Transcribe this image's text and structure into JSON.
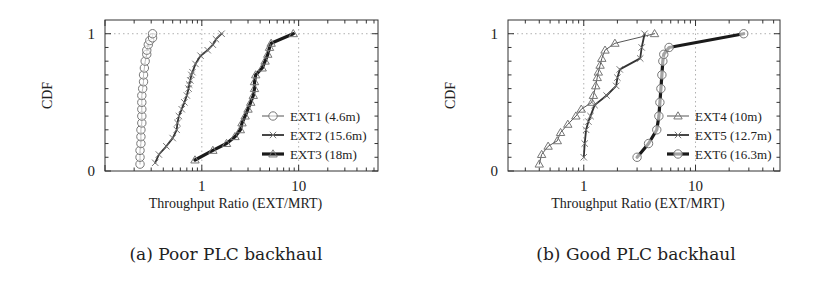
{
  "chart_data": [
    {
      "type": "line",
      "subtitle": "(a) Poor PLC backhaul",
      "xlabel": "Throughput Ratio (EXT/MRT)",
      "ylabel": "CDF",
      "xscale": "log",
      "xlim": [
        0.1,
        66
      ],
      "ylim": [
        0,
        1.1
      ],
      "xticks": [
        1,
        10
      ],
      "xtick_labels": [
        "1",
        "10"
      ],
      "yticks": [
        0,
        1
      ],
      "ytick_labels": [
        "0",
        "1"
      ],
      "grid": true,
      "legend_position": "bottom-right",
      "series": [
        {
          "name": "EXT1 (4.6m)",
          "marker": "circle",
          "line": "thin",
          "x": [
            0.23,
            0.23,
            0.23,
            0.235,
            0.235,
            0.235,
            0.24,
            0.24,
            0.24,
            0.24,
            0.24,
            0.245,
            0.25,
            0.25,
            0.255,
            0.26,
            0.27,
            0.27,
            0.28,
            0.29,
            0.31,
            0.31
          ],
          "y": [
            0.05,
            0.1,
            0.15,
            0.2,
            0.25,
            0.3,
            0.35,
            0.4,
            0.45,
            0.5,
            0.55,
            0.6,
            0.65,
            0.7,
            0.75,
            0.8,
            0.85,
            0.88,
            0.92,
            0.95,
            0.97,
            1.0
          ]
        },
        {
          "name": "EXT2 (15.6m)",
          "marker": "x",
          "line": "medium",
          "x": [
            0.33,
            0.36,
            0.43,
            0.5,
            0.55,
            0.56,
            0.58,
            0.62,
            0.66,
            0.7,
            0.73,
            0.74,
            0.76,
            0.78,
            0.8,
            0.86,
            0.97,
            1.15,
            1.3,
            1.4,
            1.6
          ],
          "y": [
            0.06,
            0.12,
            0.18,
            0.24,
            0.3,
            0.35,
            0.4,
            0.45,
            0.5,
            0.55,
            0.6,
            0.63,
            0.66,
            0.7,
            0.72,
            0.78,
            0.84,
            0.88,
            0.92,
            0.96,
            1.0
          ]
        },
        {
          "name": "EXT3 (18m)",
          "marker": "triangle",
          "line": "thick",
          "x": [
            0.85,
            1.3,
            1.8,
            2.2,
            2.5,
            2.6,
            2.8,
            3.0,
            3.2,
            3.4,
            3.5,
            3.5,
            3.6,
            4.2,
            4.5,
            4.8,
            5.0,
            5.2,
            8.8
          ],
          "y": [
            0.08,
            0.15,
            0.2,
            0.25,
            0.3,
            0.35,
            0.4,
            0.45,
            0.5,
            0.55,
            0.6,
            0.65,
            0.7,
            0.75,
            0.8,
            0.85,
            0.9,
            0.93,
            1.0
          ]
        }
      ]
    },
    {
      "type": "line",
      "subtitle": "(b) Good PLC backhaul",
      "xlabel": "Throughput Ratio (EXT/MRT)",
      "ylabel": "CDF",
      "xscale": "log",
      "xlim": [
        0.21,
        57
      ],
      "ylim": [
        0,
        1.1
      ],
      "xticks": [
        1,
        10
      ],
      "xtick_labels": [
        "1",
        "10"
      ],
      "yticks": [
        0,
        1
      ],
      "ytick_labels": [
        "0",
        "1"
      ],
      "grid": true,
      "legend_position": "bottom-right",
      "series": [
        {
          "name": "EXT4 (10m)",
          "marker": "triangle",
          "line": "thin",
          "x": [
            0.4,
            0.42,
            0.48,
            0.58,
            0.62,
            0.72,
            0.85,
            0.95,
            1.18,
            1.22,
            1.28,
            1.32,
            1.35,
            1.4,
            1.45,
            1.55,
            1.9,
            4.3
          ],
          "y": [
            0.05,
            0.12,
            0.18,
            0.22,
            0.28,
            0.34,
            0.4,
            0.45,
            0.5,
            0.55,
            0.62,
            0.68,
            0.72,
            0.77,
            0.82,
            0.88,
            0.93,
            1.0
          ]
        },
        {
          "name": "EXT5 (12.7m)",
          "marker": "x",
          "line": "medium",
          "x": [
            1.0,
            1.02,
            1.05,
            1.1,
            1.15,
            1.25,
            1.6,
            1.95,
            2.0,
            2.1,
            3.2,
            3.3,
            3.5
          ],
          "y": [
            0.1,
            0.2,
            0.3,
            0.36,
            0.4,
            0.48,
            0.55,
            0.62,
            0.68,
            0.74,
            0.82,
            0.9,
            1.0
          ]
        },
        {
          "name": "EXT6 (16.3m)",
          "marker": "circle",
          "line": "thick",
          "x": [
            3.0,
            3.8,
            4.5,
            4.7,
            4.8,
            4.9,
            5.0,
            5.1,
            5.2,
            5.8,
            27.0
          ],
          "y": [
            0.1,
            0.2,
            0.3,
            0.4,
            0.5,
            0.6,
            0.7,
            0.8,
            0.85,
            0.9,
            1.0
          ]
        }
      ]
    }
  ],
  "colors": {
    "axis": "#333333",
    "grid": "#b0b0b0",
    "thin_line": "#555555",
    "medium_line": "#333333",
    "thick_line": "#1a1a1a",
    "marker": "#777777"
  }
}
